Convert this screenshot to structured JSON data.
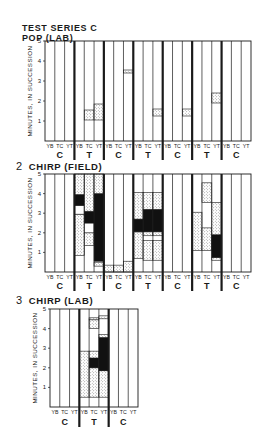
{
  "header": {
    "line1": "TEST SERIES C",
    "line2": "POP (LAB)"
  },
  "panels": [
    {
      "number": "",
      "title": "POP (LAB)"
    },
    {
      "number": "2",
      "title": "CHIRP (FIELD)"
    },
    {
      "number": "3",
      "title": "CHIRP (LAB)"
    }
  ],
  "colors": {
    "line": "#1a1a1a",
    "stipple": "#9a9a9a",
    "solid": "#111111",
    "background": "#ffffff"
  },
  "chart_data": [
    {
      "type": "bar",
      "title": "TEST SERIES C — POP (LAB)",
      "xlabel": "",
      "ylabel": "MINUTES, IN SUCCESSION",
      "ylim": [
        0,
        5
      ],
      "yticks": [
        1,
        2,
        3,
        4,
        5
      ],
      "subcolumns": [
        "YB",
        "TC",
        "YT"
      ],
      "groups": [
        "C",
        "T",
        "C",
        "T",
        "C",
        "T",
        "C"
      ],
      "segments": [
        {
          "group": 1,
          "col": "TC",
          "from": 1.05,
          "to": 1.55,
          "fill": "stipple"
        },
        {
          "group": 1,
          "col": "YT",
          "from": 1.05,
          "to": 1.85,
          "fill": "stipple"
        },
        {
          "group": 2,
          "col": "YT",
          "from": 3.4,
          "to": 3.55,
          "fill": "stipple"
        },
        {
          "group": 3,
          "col": "YT",
          "from": 1.25,
          "to": 1.6,
          "fill": "stipple"
        },
        {
          "group": 4,
          "col": "YT",
          "from": 1.25,
          "to": 1.6,
          "fill": "stipple"
        },
        {
          "group": 5,
          "col": "YT",
          "from": 1.9,
          "to": 2.4,
          "fill": "stipple"
        }
      ]
    },
    {
      "type": "bar",
      "title": "CHIRP (FIELD)",
      "xlabel": "",
      "ylabel": "MINUTES, IN SUCCESSION",
      "ylim": [
        0,
        5
      ],
      "yticks": [
        1,
        2,
        3,
        4,
        5
      ],
      "subcolumns": [
        "YB",
        "TC",
        "YT"
      ],
      "groups": [
        "C",
        "T",
        "C",
        "T",
        "C",
        "T",
        "C"
      ],
      "segments": [
        {
          "group": 1,
          "col": "YB",
          "from": 0.85,
          "to": 2.95,
          "fill": "stipple"
        },
        {
          "group": 1,
          "col": "YB",
          "from": 2.95,
          "to": 3.4,
          "fill": "none"
        },
        {
          "group": 1,
          "col": "YB",
          "from": 3.4,
          "to": 3.95,
          "fill": "solid"
        },
        {
          "group": 1,
          "col": "YB",
          "from": 3.95,
          "to": 5.0,
          "fill": "stipple"
        },
        {
          "group": 1,
          "col": "TC",
          "from": 1.35,
          "to": 2.0,
          "fill": "stipple"
        },
        {
          "group": 1,
          "col": "TC",
          "from": 2.0,
          "to": 2.5,
          "fill": "none"
        },
        {
          "group": 1,
          "col": "TC",
          "from": 2.5,
          "to": 3.1,
          "fill": "solid"
        },
        {
          "group": 1,
          "col": "TC",
          "from": 3.1,
          "to": 5.0,
          "fill": "stipple"
        },
        {
          "group": 1,
          "col": "YT",
          "from": 0.3,
          "to": 0.5,
          "fill": "stipple"
        },
        {
          "group": 1,
          "col": "YT",
          "from": 0.55,
          "to": 4.0,
          "fill": "solid"
        },
        {
          "group": 1,
          "col": "YT",
          "from": 4.0,
          "to": 5.0,
          "fill": "stipple"
        },
        {
          "group": 2,
          "col": "YB",
          "from": 0.0,
          "to": 0.35,
          "fill": "stipple"
        },
        {
          "group": 2,
          "col": "TC",
          "from": 0.0,
          "to": 0.35,
          "fill": "stipple"
        },
        {
          "group": 2,
          "col": "YT",
          "from": 0.0,
          "to": 0.55,
          "fill": "stipple"
        },
        {
          "group": 3,
          "col": "YB",
          "from": 0.7,
          "to": 2.05,
          "fill": "stipple"
        },
        {
          "group": 3,
          "col": "YB",
          "from": 2.05,
          "to": 2.7,
          "fill": "none"
        },
        {
          "group": 3,
          "col": "YB",
          "from": 2.05,
          "to": 2.7,
          "fill": "solid"
        },
        {
          "group": 3,
          "col": "YB",
          "from": 2.7,
          "to": 4.05,
          "fill": "stipple"
        },
        {
          "group": 3,
          "col": "TC",
          "from": 0.6,
          "to": 1.6,
          "fill": "stipple"
        },
        {
          "group": 3,
          "col": "TC",
          "from": 1.85,
          "to": 2.05,
          "fill": "stipple"
        },
        {
          "group": 3,
          "col": "TC",
          "from": 2.05,
          "to": 3.2,
          "fill": "solid"
        },
        {
          "group": 3,
          "col": "TC",
          "from": 3.2,
          "to": 4.05,
          "fill": "stipple"
        },
        {
          "group": 3,
          "col": "YT",
          "from": 0.6,
          "to": 1.6,
          "fill": "stipple"
        },
        {
          "group": 3,
          "col": "YT",
          "from": 1.85,
          "to": 2.05,
          "fill": "stipple"
        },
        {
          "group": 3,
          "col": "YT",
          "from": 2.05,
          "to": 3.2,
          "fill": "solid"
        },
        {
          "group": 3,
          "col": "YT",
          "from": 3.2,
          "to": 4.05,
          "fill": "stipple"
        },
        {
          "group": 5,
          "col": "YB",
          "from": 1.1,
          "to": 3.05,
          "fill": "stipple"
        },
        {
          "group": 5,
          "col": "TC",
          "from": 1.1,
          "to": 2.25,
          "fill": "stipple"
        },
        {
          "group": 5,
          "col": "TC",
          "from": 3.55,
          "to": 4.55,
          "fill": "stipple"
        },
        {
          "group": 5,
          "col": "YT",
          "from": 0.6,
          "to": 0.75,
          "fill": "stipple"
        },
        {
          "group": 5,
          "col": "YT",
          "from": 0.75,
          "to": 1.9,
          "fill": "solid"
        },
        {
          "group": 5,
          "col": "YT",
          "from": 1.9,
          "to": 3.55,
          "fill": "stipple"
        }
      ]
    },
    {
      "type": "bar",
      "title": "CHIRP (LAB)",
      "xlabel": "",
      "ylabel": "MINUTES, IN SUCCESSION",
      "ylim": [
        0,
        5
      ],
      "yticks": [
        1,
        2,
        3,
        4,
        5
      ],
      "subcolumns": [
        "YB",
        "TC",
        "YT"
      ],
      "groups": [
        "C",
        "T",
        "C"
      ],
      "segments": [
        {
          "group": 1,
          "col": "YB",
          "from": 0.5,
          "to": 2.85,
          "fill": "stipple"
        },
        {
          "group": 1,
          "col": "TC",
          "from": 0.5,
          "to": 2.0,
          "fill": "stipple"
        },
        {
          "group": 1,
          "col": "TC",
          "from": 2.0,
          "to": 2.5,
          "fill": "solid"
        },
        {
          "group": 1,
          "col": "TC",
          "from": 2.5,
          "to": 2.85,
          "fill": "stipple"
        },
        {
          "group": 1,
          "col": "TC",
          "from": 4.0,
          "to": 4.45,
          "fill": "stipple"
        },
        {
          "group": 1,
          "col": "TC",
          "from": 4.45,
          "to": 4.55,
          "fill": "stipple"
        },
        {
          "group": 1,
          "col": "YT",
          "from": 0.5,
          "to": 1.85,
          "fill": "stipple"
        },
        {
          "group": 1,
          "col": "YT",
          "from": 1.85,
          "to": 3.55,
          "fill": "solid"
        },
        {
          "group": 1,
          "col": "YT",
          "from": 3.55,
          "to": 3.7,
          "fill": "stipple"
        },
        {
          "group": 1,
          "col": "YT",
          "from": 4.5,
          "to": 4.65,
          "fill": "stipple"
        }
      ]
    }
  ]
}
